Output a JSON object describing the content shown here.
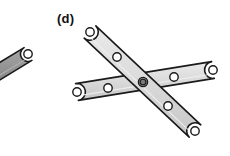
{
  "figure": {
    "panel_label": "(d)",
    "panel_label_x": 57,
    "panel_label_y": 12,
    "caption_visible_text": "(d)",
    "background_color": "#ffffff",
    "canvas": {
      "width": 230,
      "height": 156
    }
  },
  "style": {
    "link_fill": "#d8d8d8",
    "link_fill_light": "#e4e4e4",
    "link_fill_dark": "#9a9a9a",
    "link_stroke": "#1a1a1a",
    "link_stroke_width": 1.6,
    "hole_fill": "#ffffff",
    "hole_stroke": "#1a1a1a",
    "hole_stroke_width": 1.4,
    "pivot_fill": "#8c8c8c",
    "hole_radius_outer": 4.2,
    "hole_radius_inner": 2.4
  },
  "links": [
    {
      "id": "link-partial-left",
      "name": "partial-link-left-edge",
      "description": "dark partial bar cut off at left image edge",
      "fill": "#9a9a9a",
      "half_width": 7.5,
      "endpoints": [
        {
          "x": -18,
          "y": 82
        },
        {
          "x": 28,
          "y": 54
        }
      ],
      "holes": [
        {
          "x": 28,
          "y": 54,
          "type": "open"
        }
      ]
    },
    {
      "id": "link-diagonal",
      "name": "diagonal-link-upper-left-to-lower-right",
      "description": "long bar running from top-left down to bottom-right, passing over/under the lower bar at the pivot",
      "fill": "#d8d8d8",
      "half_width": 8.5,
      "endpoints": [
        {
          "x": 90,
          "y": 32
        },
        {
          "x": 195,
          "y": 131
        }
      ],
      "holes": [
        {
          "x": 90,
          "y": 32,
          "type": "open"
        },
        {
          "x": 117,
          "y": 57,
          "type": "open"
        },
        {
          "x": 143,
          "y": 82,
          "type": "pivot"
        },
        {
          "x": 168,
          "y": 106,
          "type": "open"
        },
        {
          "x": 195,
          "y": 131,
          "type": "open"
        }
      ]
    },
    {
      "id": "link-shallow",
      "name": "shallow-link-lower-left-to-right",
      "description": "bar running from lower-left up to the right edge, crossing the diagonal link",
      "fill": "#d8d8d8",
      "half_width": 8.5,
      "endpoints": [
        {
          "x": 77,
          "y": 92
        },
        {
          "x": 213,
          "y": 70
        }
      ],
      "holes": [
        {
          "x": 77,
          "y": 92,
          "type": "open"
        },
        {
          "x": 108,
          "y": 88,
          "type": "open"
        },
        {
          "x": 143,
          "y": 82,
          "type": "pivot"
        },
        {
          "x": 174,
          "y": 77,
          "type": "open"
        },
        {
          "x": 213,
          "y": 70,
          "type": "open"
        }
      ]
    }
  ],
  "pivot": {
    "name": "center-pivot-joint",
    "x": 143,
    "y": 82,
    "fill": "#8c8c8c",
    "radius_outer": 4.6,
    "radius_inner": 2.8
  }
}
